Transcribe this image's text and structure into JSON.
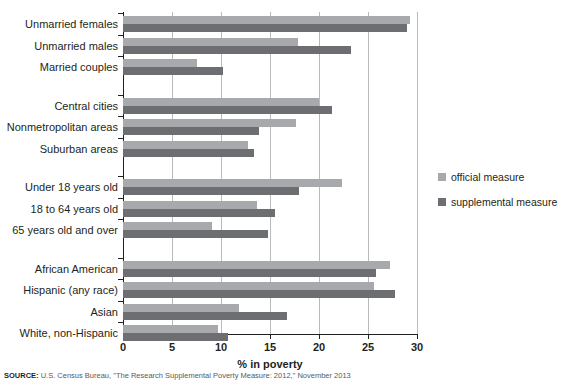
{
  "chart_data": {
    "type": "bar",
    "orientation": "horizontal",
    "title": "",
    "xlabel": "% in poverty",
    "ylabel": "",
    "xlim": [
      0,
      30
    ],
    "xticks": [
      0,
      5,
      10,
      15,
      20,
      25,
      30
    ],
    "grid": true,
    "legend_position": "right",
    "categories": [
      "Unmarried females",
      "Unmarried males",
      "Married couples",
      "Central cities",
      "Nonmetropolitan areas",
      "Suburban areas",
      "Under 18 years old",
      "18 to 64 years old",
      "65 years old and over",
      "African American",
      "Hispanic (any race)",
      "Asian",
      "White, non-Hispanic"
    ],
    "series": [
      {
        "name": "official measure",
        "color": "#a7a9ac",
        "values": [
          29.3,
          17.9,
          7.5,
          20.0,
          17.7,
          12.8,
          22.3,
          13.7,
          9.1,
          27.2,
          25.6,
          11.8,
          9.7
        ]
      },
      {
        "name": "supplemental measure",
        "color": "#6d6e71",
        "values": [
          29.0,
          23.3,
          10.2,
          21.3,
          13.9,
          13.4,
          18.0,
          15.5,
          14.8,
          25.8,
          27.8,
          16.7,
          10.7
        ]
      }
    ],
    "group_breaks": [
      3,
      6,
      9
    ],
    "source": "SOURCE: U.S. Census Bureau, \"The Research Supplemental Poverty Measure: 2012,\" November 2013"
  },
  "source_prefix": "SOURCE:",
  "source_text": " U.S. Census Bureau, \"The Research Supplemental Poverty Measure: 2012,\" November 2013"
}
